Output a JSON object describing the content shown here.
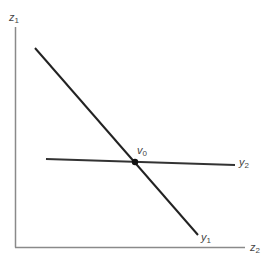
{
  "diagram": {
    "axes": {
      "vertical": {
        "label": "z",
        "subscript": "1"
      },
      "horizontal": {
        "label": "z",
        "subscript": "2"
      }
    },
    "lines": [
      {
        "name": "y1-line",
        "label": "y",
        "subscript": "1",
        "from": [
          35,
          48
        ],
        "to": [
          198,
          235
        ]
      },
      {
        "name": "y2-line",
        "label": "y",
        "subscript": "2",
        "from": [
          46,
          159
        ],
        "to": [
          235,
          165
        ]
      }
    ],
    "intersection": {
      "label": "v",
      "subscript": "0",
      "point": [
        135,
        162
      ]
    },
    "colors": {
      "line": "#222222",
      "axis": "#777777",
      "text": "#444444"
    }
  }
}
